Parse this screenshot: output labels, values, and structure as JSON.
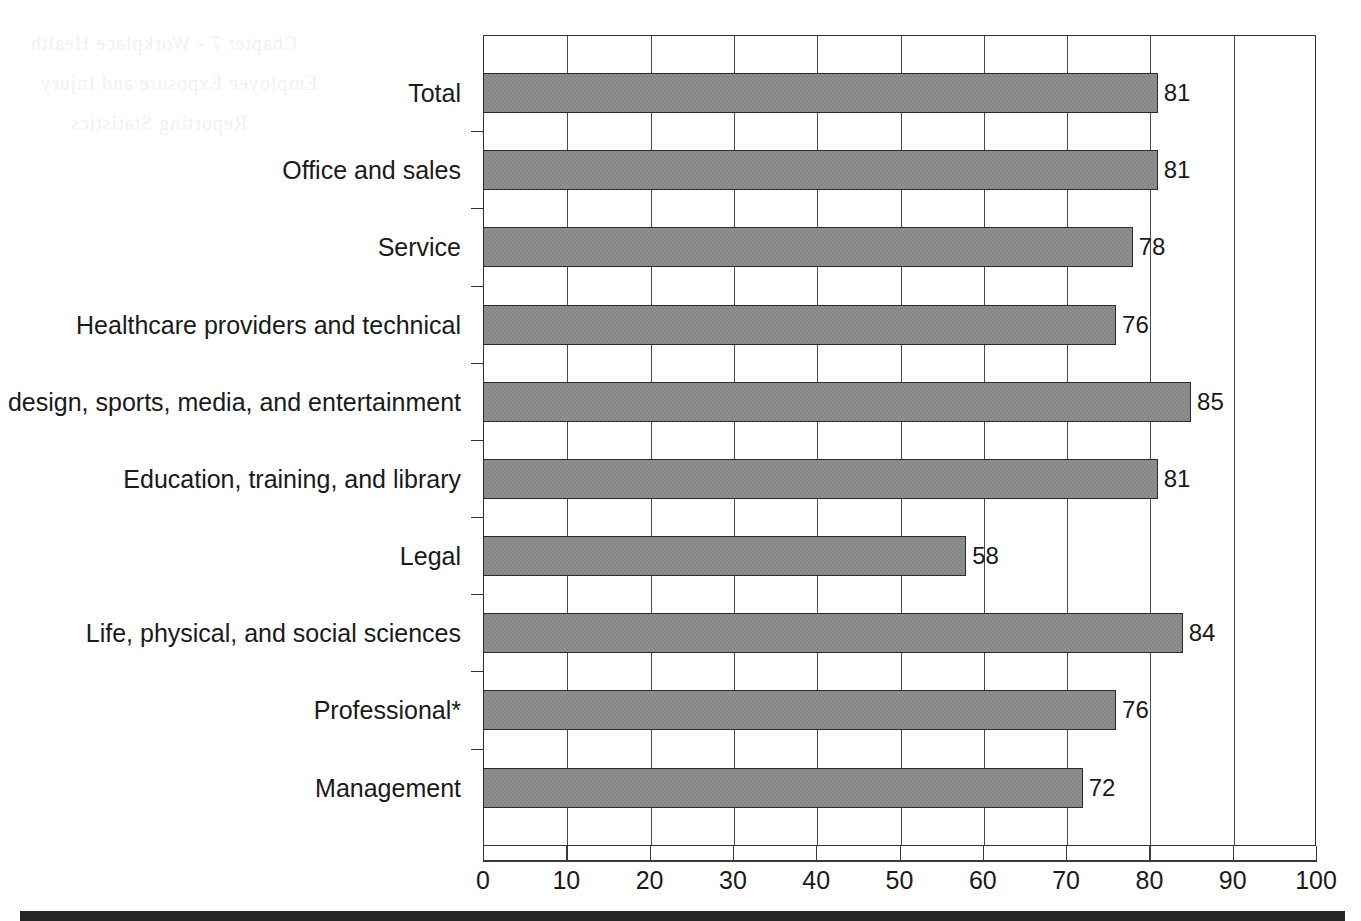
{
  "chart_data": {
    "type": "bar",
    "orientation": "horizontal",
    "title": "",
    "subtitle": "",
    "xlabel": "",
    "ylabel": "",
    "xlim": [
      0,
      100
    ],
    "ylim": null,
    "grid": true,
    "legend": null,
    "xticks": [
      0,
      10,
      20,
      30,
      40,
      50,
      60,
      70,
      80,
      90,
      100
    ],
    "xtick_labels": [
      "0",
      "10",
      "20",
      "30",
      "40",
      "50",
      "60",
      "70",
      "80",
      "90",
      "100"
    ],
    "categories": [
      "Total",
      "Office and sales",
      "Service",
      "Healthcare providers and technical",
      "Arts, design, sports, media, and entertainment",
      "Education, training, and library",
      "Legal",
      "Life, physical, and social sciences",
      "Professional*",
      "Management"
    ],
    "values": [
      81,
      81,
      78,
      76,
      85,
      81,
      58,
      84,
      76,
      72
    ],
    "data_labels": [
      "81",
      "81",
      "78",
      "76",
      "85",
      "81",
      "58",
      "84",
      "76",
      "72"
    ],
    "series": [
      {
        "name": "Percent",
        "values": [
          81,
          81,
          78,
          76,
          85,
          81,
          58,
          84,
          76,
          72
        ]
      }
    ],
    "bar_color": "#848484",
    "bar_edge_color": "#2b2b2b",
    "axis_color": "#333333",
    "grid_color": "#4a4a4a",
    "background_color": "#ffffff",
    "annotations": [
      "*Professional category is marked with an asterisk"
    ]
  },
  "ghost_text": {
    "lines": [
      "Chapter 7 - Workplace Health",
      "Employee Exposure and Injury",
      "Reporting Statistics"
    ]
  },
  "decor": {
    "bottom_rule_color": "#262626"
  }
}
